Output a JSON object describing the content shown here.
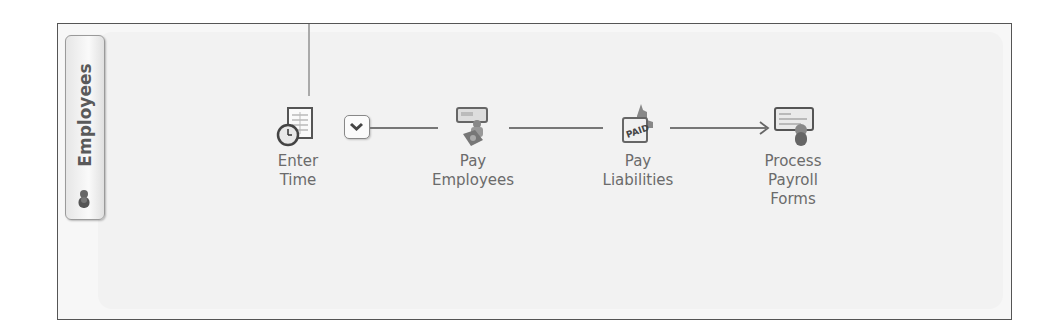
{
  "panel": {
    "tab_label": "Employees",
    "tab_icon": "people-icon"
  },
  "workflow": {
    "nodes": [
      {
        "id": "enter-time",
        "line1": "Enter",
        "line2": "Time",
        "line3": "",
        "icon": "timesheet-clock-icon"
      },
      {
        "id": "pay-employees",
        "line1": "Pay",
        "line2": "Employees",
        "line3": "",
        "icon": "paycheck-person-icon"
      },
      {
        "id": "pay-liabilities",
        "line1": "Pay",
        "line2": "Liabilities",
        "line3": "",
        "icon": "paid-stamp-capitol-icon"
      },
      {
        "id": "process-payroll-forms",
        "line1": "Process",
        "line2": "Payroll",
        "line3": "Forms",
        "icon": "payroll-form-icon"
      }
    ],
    "dropdown_icon": "chevron-down-icon"
  },
  "colors": {
    "frame_border": "#555555",
    "panel_bg": "#f2f2f2",
    "text": "#6b6b6b",
    "connector": "#777777"
  }
}
